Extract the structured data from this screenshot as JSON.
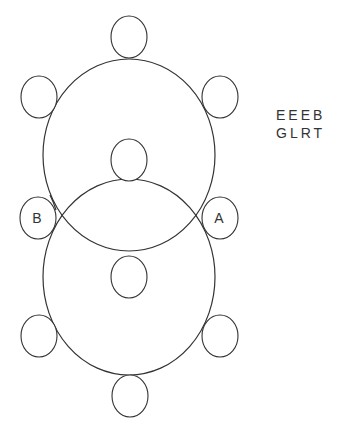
{
  "diagram": {
    "colors": {
      "stroke": "#333333",
      "background": "#ffffff"
    },
    "large_circles": [
      {
        "name": "upper",
        "cx": 129,
        "cy": 155,
        "rx": 86,
        "ry": 96
      },
      {
        "name": "lower",
        "cx": 129,
        "cy": 277,
        "rx": 86,
        "ry": 98
      }
    ],
    "small_circles": [
      {
        "id": "top",
        "cx": 129,
        "cy": 37,
        "label": ""
      },
      {
        "id": "upper-left",
        "cx": 39,
        "cy": 97,
        "label": ""
      },
      {
        "id": "upper-right",
        "cx": 220,
        "cy": 97,
        "label": ""
      },
      {
        "id": "inner-top",
        "cx": 129,
        "cy": 160,
        "label": ""
      },
      {
        "id": "left-B",
        "cx": 38,
        "cy": 218,
        "label": "B"
      },
      {
        "id": "right-A",
        "cx": 220,
        "cy": 218,
        "label": "A"
      },
      {
        "id": "inner-bottom",
        "cx": 129,
        "cy": 277,
        "label": ""
      },
      {
        "id": "lower-left",
        "cx": 39,
        "cy": 336,
        "label": ""
      },
      {
        "id": "lower-right",
        "cx": 220,
        "cy": 336,
        "label": ""
      },
      {
        "id": "bottom",
        "cx": 130,
        "cy": 396,
        "label": ""
      }
    ],
    "labels": {
      "A": "A",
      "B": "B"
    },
    "code_text": {
      "line1": "EEEB",
      "line2": "GLRT"
    }
  }
}
